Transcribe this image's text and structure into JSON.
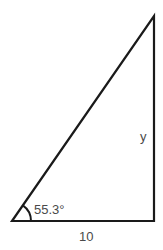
{
  "diagram": {
    "type": "right-triangle",
    "colors": {
      "stroke": "#1a1a1a",
      "text": "#4a4a4a",
      "background": "#ffffff"
    },
    "vertices": {
      "bottom_left": [
        12,
        221
      ],
      "bottom_right": [
        154,
        221
      ],
      "top": [
        154,
        16
      ]
    },
    "labels": {
      "angle": "55.3°",
      "base": "10",
      "height": "y"
    }
  }
}
